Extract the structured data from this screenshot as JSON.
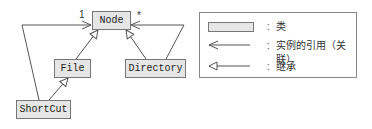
{
  "diagram": {
    "type": "UML class diagram",
    "classes": [
      {
        "id": "node",
        "name": "Node"
      },
      {
        "id": "file",
        "name": "File"
      },
      {
        "id": "directory",
        "name": "Directory"
      },
      {
        "id": "shortcut",
        "name": "ShortCut"
      }
    ],
    "relations": [
      {
        "from": "File",
        "to": "Node",
        "kind": "inheritance"
      },
      {
        "from": "Directory",
        "to": "Node",
        "kind": "inheritance"
      },
      {
        "from": "ShortCut",
        "to": "File",
        "kind": "inheritance"
      },
      {
        "from": "ShortCut",
        "to": "Node",
        "kind": "association",
        "multiplicity": "1"
      },
      {
        "from": "Directory",
        "to": "Node",
        "kind": "association",
        "multiplicity": "*"
      }
    ],
    "multiplicities": {
      "shortcut_node": "1",
      "directory_node": "*"
    }
  },
  "legend": {
    "class_label": "类",
    "association_label": "实例的引用（关联）",
    "inheritance_label": "继承",
    "separator": "："
  }
}
